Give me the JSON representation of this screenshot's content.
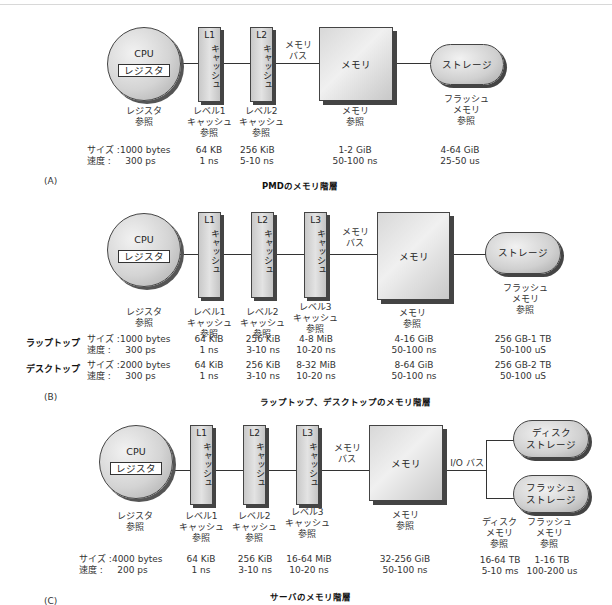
{
  "sections": {
    "a": {
      "label": "(A)",
      "caption": "PMDのメモリ階層",
      "cpu": {
        "title": "CPU",
        "register": "レジスタ"
      },
      "caches": [
        {
          "name": "L1",
          "text": "キャッシュ"
        },
        {
          "name": "L2",
          "text": "キャッシュ"
        }
      ],
      "bus_label": [
        "メモリ",
        "バス"
      ],
      "memory_label": "メモリ",
      "storage_label": "ストレージ",
      "ref_labels": {
        "register": [
          "レジスタ",
          "参照"
        ],
        "l1": [
          "レベル1",
          "キャッシュ",
          "参照"
        ],
        "l2": [
          "レベル2",
          "キャッシュ",
          "参照"
        ],
        "memory": [
          "メモリ",
          "参照"
        ],
        "storage": [
          "フラッシュ",
          "メモリ",
          "参照"
        ]
      },
      "specs": {
        "size_label": "サイズ :",
        "speed_label": "速度 :",
        "register": {
          "size": "1000 bytes",
          "speed": "300 ps"
        },
        "l1": {
          "size": "64 KB",
          "speed": "1 ns"
        },
        "l2": {
          "size": "256 KiB",
          "speed": "5-10 ns"
        },
        "memory": {
          "size": "1-2 GiB",
          "speed": "50-100 ns"
        },
        "storage": {
          "size": "4-64 GiB",
          "speed": "25-50 us"
        }
      }
    },
    "b": {
      "label": "(B)",
      "caption": "ラップトップ、デスクトップのメモリ階層",
      "cpu": {
        "title": "CPU",
        "register": "レジスタ"
      },
      "caches": [
        {
          "name": "L1",
          "text": "キャッシュ"
        },
        {
          "name": "L2",
          "text": "キャッシュ"
        },
        {
          "name": "L3",
          "text": "キャッシュ"
        }
      ],
      "bus_label": [
        "メモリ",
        "バス"
      ],
      "memory_label": "メモリ",
      "storage_label": "ストレージ",
      "ref_labels": {
        "register": [
          "レジスタ",
          "参照"
        ],
        "l1": [
          "レベル1",
          "キャッシュ",
          "参照"
        ],
        "l2": [
          "レベル2",
          "キャッシュ",
          "参照"
        ],
        "l3": [
          "レベル3",
          "キャッシュ",
          "参照"
        ],
        "memory": [
          "メモリ",
          "参照"
        ],
        "storage": [
          "フラッシュ",
          "メモリ",
          "参照"
        ]
      },
      "rows": [
        {
          "device": "ラップトップ",
          "size_label": "サイズ :",
          "speed_label": "速度 :",
          "register": {
            "size": "1000 bytes",
            "speed": "300 ps"
          },
          "l1": {
            "size": "64 KiB",
            "speed": "1 ns"
          },
          "l2": {
            "size": "256 KiB",
            "speed": "3-10 ns"
          },
          "l3": {
            "size": "4-8 MiB",
            "speed": "10-20 ns"
          },
          "memory": {
            "size": "4-16 GiB",
            "speed": "50-100 ns"
          },
          "storage": {
            "size": "256 GB-1 TB",
            "speed": "50-100 uS"
          }
        },
        {
          "device": "デスクトップ",
          "size_label": "サイズ :",
          "speed_label": "速度 :",
          "register": {
            "size": "2000 bytes",
            "speed": "300 ps"
          },
          "l1": {
            "size": "64 KiB",
            "speed": "1 ns"
          },
          "l2": {
            "size": "256 KiB",
            "speed": "3-10 ns"
          },
          "l3": {
            "size": "8-32  MiB",
            "speed": "10-20 ns"
          },
          "memory": {
            "size": "8-64 GiB",
            "speed": "50-100 ns"
          },
          "storage": {
            "size": "256 GB-2 TB",
            "speed": "50-100 uS"
          }
        }
      ]
    },
    "c": {
      "label": "(C)",
      "caption": "サーバのメモリ階層",
      "cpu": {
        "title": "CPU",
        "register": "レジスタ"
      },
      "caches": [
        {
          "name": "L1",
          "text": "キャッシュ"
        },
        {
          "name": "L2",
          "text": "キャッシュ"
        },
        {
          "name": "L3",
          "text": "キャッシュ"
        }
      ],
      "bus_label": [
        "メモリ",
        "バス"
      ],
      "io_bus_label": "I/O バス",
      "memory_label": "メモリ",
      "disk_storage_label": "ディスク\nストレージ",
      "flash_storage_label": "フラッシュ\nストレージ",
      "ref_labels": {
        "register": [
          "レジスタ",
          "参照"
        ],
        "l1": [
          "レベル1",
          "キャッシュ",
          "参照"
        ],
        "l2": [
          "レベル2",
          "キャッシュ",
          "参照"
        ],
        "l3": [
          "レベル3",
          "キャッシュ",
          "参照"
        ],
        "memory": [
          "メモリ",
          "参照"
        ],
        "disk": [
          "ディスク",
          "メモリ",
          "参照"
        ],
        "flash": [
          "フラッシュ",
          "メモリ",
          "参照"
        ]
      },
      "specs": {
        "size_label": "サイズ :",
        "speed_label": "速度 :",
        "register": {
          "size": "4000 bytes",
          "speed": "200 ps"
        },
        "l1": {
          "size": "64 KiB",
          "speed": "1 ns"
        },
        "l2": {
          "size": "256 KiB",
          "speed": "3-10 ns"
        },
        "l3": {
          "size": "16-64 MiB",
          "speed": "10-20 ns"
        },
        "memory": {
          "size": "32-256 GiB",
          "speed": "50-100 ns"
        },
        "disk": {
          "size": "16-64 TB",
          "speed": "5-10 ms"
        },
        "flash": {
          "size": "1-16 TB",
          "speed": "100-200 us"
        }
      }
    }
  }
}
